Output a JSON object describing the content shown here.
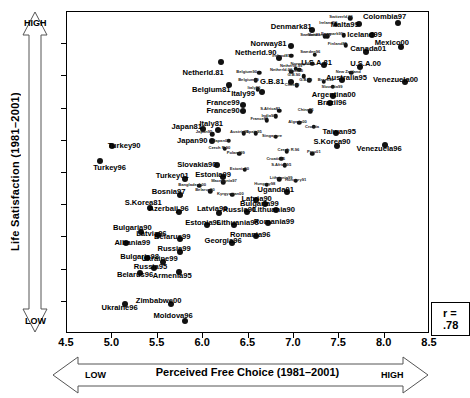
{
  "chart_data": {
    "type": "scatter",
    "title": "",
    "xlabel": "Perceived Free Choice (1981–2001)",
    "ylabel": "Life Satisfaction (1981–2001)",
    "xlim": [
      4.5,
      8.5
    ],
    "ylim": [
      3.5,
      8.5
    ],
    "xticks": [
      "4.5",
      "5.0",
      "5.5",
      "6.0",
      "6.5",
      "7.0",
      "7.5",
      "8.0",
      "8.5"
    ],
    "yticks": [
      "3.5",
      "4.0",
      "4.5",
      "5.0",
      "5.5",
      "6.0",
      "6.5",
      "7.0",
      "7.5",
      "8.0",
      "8.5"
    ],
    "grid": false,
    "legend": "none",
    "annotation": "r = .78",
    "x_axis_low_label": "LOW",
    "x_axis_high_label": "HIGH",
    "y_axis_low_label": "LOW",
    "y_axis_high_label": "HIGH",
    "marker_color": "#111111",
    "points": [
      {
        "label": "Netherld.81",
        "x": 6.2,
        "y": 7.72,
        "lx": 6.0,
        "ly": 7.56,
        "big": true
      },
      {
        "label": "Netherld.90",
        "x": 6.84,
        "y": 7.78,
        "lx": 6.58,
        "ly": 7.86,
        "big": true
      },
      {
        "label": "Netherld.99",
        "x": 7.02,
        "y": 7.62,
        "lx": 6.97,
        "ly": 7.66,
        "s": true
      },
      {
        "label": "Netherld.00",
        "x": 6.97,
        "y": 7.57,
        "lx": 6.86,
        "ly": 7.6,
        "s": true
      },
      {
        "label": "Denmark81",
        "x": 7.2,
        "y": 8.22,
        "lx": 6.97,
        "ly": 8.27,
        "big": true
      },
      {
        "label": "Norway81",
        "x": 6.97,
        "y": 7.97,
        "lx": 6.72,
        "ly": 8.0,
        "big": true
      },
      {
        "label": "Sweden81",
        "x": 7.34,
        "y": 8.12,
        "lx": 7.18,
        "ly": 8.14,
        "s": true
      },
      {
        "label": "Ireland81",
        "x": 6.97,
        "y": 7.82,
        "lx": 6.86,
        "ly": 7.82,
        "s": true
      },
      {
        "label": "Ireland90",
        "x": 7.46,
        "y": 8.3,
        "lx": 7.38,
        "ly": 8.33,
        "s": true
      },
      {
        "label": "Switzerld.96",
        "x": 7.62,
        "y": 8.4,
        "lx": 7.52,
        "ly": 8.43,
        "s": true
      },
      {
        "label": "Malta99",
        "x": 7.72,
        "y": 8.32,
        "lx": 7.56,
        "ly": 8.3,
        "big": true
      },
      {
        "label": "Colombia97",
        "x": 8.15,
        "y": 8.33,
        "lx": 8.0,
        "ly": 8.42,
        "big": true
      },
      {
        "label": "Iceland99",
        "x": 7.86,
        "y": 8.14,
        "lx": 7.78,
        "ly": 8.14,
        "big": true
      },
      {
        "label": "Denmark99",
        "x": 7.55,
        "y": 8.14,
        "lx": 7.42,
        "ly": 8.16,
        "s": true
      },
      {
        "label": "Switzerld.89",
        "x": 7.37,
        "y": 8.12,
        "lx": 7.28,
        "ly": 8.14,
        "s": true
      },
      {
        "label": "Mexico00",
        "x": 8.18,
        "y": 7.96,
        "lx": 8.08,
        "ly": 8.02,
        "big": true
      },
      {
        "label": "Finland81",
        "x": 7.57,
        "y": 7.98,
        "lx": 7.48,
        "ly": 8.0,
        "s": true
      },
      {
        "label": "Canada01",
        "x": 7.79,
        "y": 7.88,
        "lx": 7.82,
        "ly": 7.92,
        "big": true
      },
      {
        "label": "U.S.A.81",
        "x": 7.33,
        "y": 7.68,
        "lx": 7.25,
        "ly": 7.71,
        "big": true
      },
      {
        "label": "U.S.A.00",
        "x": 7.73,
        "y": 7.64,
        "lx": 7.79,
        "ly": 7.69,
        "big": true
      },
      {
        "label": "New Zealand",
        "x": 7.63,
        "y": 7.56,
        "lx": 7.6,
        "ly": 7.57,
        "s": true
      },
      {
        "label": "Norway96",
        "x": 7.2,
        "y": 7.7,
        "lx": 7.07,
        "ly": 7.7,
        "s": true
      },
      {
        "label": "Sweden96",
        "x": 7.23,
        "y": 7.84,
        "lx": 7.18,
        "ly": 7.88,
        "s": true
      },
      {
        "label": "Australia95",
        "x": 7.53,
        "y": 7.44,
        "lx": 7.58,
        "ly": 7.48,
        "big": true
      },
      {
        "label": "Venezuela00",
        "x": 8.23,
        "y": 7.42,
        "lx": 8.12,
        "ly": 7.44,
        "big": true
      },
      {
        "label": "G.B.81",
        "x": 6.97,
        "y": 7.42,
        "lx": 6.76,
        "ly": 7.42,
        "big": true
      },
      {
        "label": "G.B.90",
        "x": 7.11,
        "y": 7.5,
        "lx": 7.0,
        "ly": 7.52,
        "s": true
      },
      {
        "label": "G.B.99",
        "x": 7.17,
        "y": 7.44,
        "lx": 7.13,
        "ly": 7.44,
        "s": true
      },
      {
        "label": "Belgium81",
        "x": 6.29,
        "y": 7.36,
        "lx": 6.09,
        "ly": 7.29,
        "big": true
      },
      {
        "label": "Belgium90",
        "x": 6.62,
        "y": 7.56,
        "lx": 6.48,
        "ly": 7.57,
        "s": true
      },
      {
        "label": "Belgium99",
        "x": 6.58,
        "y": 7.44,
        "lx": 6.5,
        "ly": 7.44,
        "s": true
      },
      {
        "label": "Italy99",
        "x": 6.65,
        "y": 7.26,
        "lx": 6.44,
        "ly": 7.22,
        "big": true
      },
      {
        "label": "Italy90",
        "x": 6.6,
        "y": 7.3,
        "lx": 6.56,
        "ly": 7.32,
        "s": true
      },
      {
        "label": "Chile00",
        "x": 7.06,
        "y": 7.6,
        "lx": 7.02,
        "ly": 7.58,
        "s": true
      },
      {
        "label": "Chile90",
        "x": 7.03,
        "y": 7.36,
        "lx": 6.98,
        "ly": 7.36,
        "s": true
      },
      {
        "label": "Brazil90",
        "x": 7.33,
        "y": 7.42,
        "lx": 7.35,
        "ly": 7.44,
        "s": true
      },
      {
        "label": "Slovakia99",
        "x": 7.43,
        "y": 7.34,
        "lx": 7.42,
        "ly": 7.34,
        "s": true
      },
      {
        "label": "Argentina00",
        "x": 7.43,
        "y": 7.2,
        "lx": 7.44,
        "ly": 7.21,
        "big": true
      },
      {
        "label": "Brazil96",
        "x": 7.4,
        "y": 7.08,
        "lx": 7.42,
        "ly": 7.08,
        "big": true
      },
      {
        "label": "France99",
        "x": 6.44,
        "y": 7.06,
        "lx": 6.22,
        "ly": 7.08,
        "big": true
      },
      {
        "label": "France90",
        "x": 6.44,
        "y": 6.96,
        "lx": 6.22,
        "ly": 6.96,
        "big": true
      },
      {
        "label": "France81",
        "x": 6.7,
        "y": 6.82,
        "lx": 6.62,
        "ly": 6.84,
        "s": true
      },
      {
        "label": "S.Africa81",
        "x": 6.84,
        "y": 6.97,
        "lx": 6.74,
        "ly": 6.99,
        "s": true
      },
      {
        "label": "India90",
        "x": 6.8,
        "y": 6.88,
        "lx": 6.72,
        "ly": 6.88,
        "s": true
      },
      {
        "label": "China95",
        "x": 7.18,
        "y": 6.96,
        "lx": 7.13,
        "ly": 6.98,
        "s": true
      },
      {
        "label": "Japan81",
        "x": 6.0,
        "y": 6.68,
        "lx": 5.82,
        "ly": 6.72,
        "big": true
      },
      {
        "label": "Italy81",
        "x": 6.16,
        "y": 6.66,
        "lx": 6.09,
        "ly": 6.76,
        "big": true
      },
      {
        "label": "Japan95",
        "x": 6.1,
        "y": 6.6,
        "lx": 6.01,
        "ly": 6.64,
        "s": true
      },
      {
        "label": "Japan90",
        "x": 6.1,
        "y": 6.5,
        "lx": 5.88,
        "ly": 6.5,
        "big": true
      },
      {
        "label": "Japan00",
        "x": 6.28,
        "y": 6.5,
        "lx": 6.2,
        "ly": 6.5,
        "s": true
      },
      {
        "label": "Austria90",
        "x": 6.45,
        "y": 6.62,
        "lx": 6.4,
        "ly": 6.64,
        "s": true
      },
      {
        "label": "Spain95",
        "x": 6.58,
        "y": 6.62,
        "lx": 6.56,
        "ly": 6.63,
        "s": true
      },
      {
        "label": "Singapore",
        "x": 6.8,
        "y": 6.56,
        "lx": 6.76,
        "ly": 6.58,
        "s": true
      },
      {
        "label": "Taiwan95",
        "x": 7.46,
        "y": 6.62,
        "lx": 7.5,
        "ly": 6.63,
        "big": true
      },
      {
        "label": "S.Korea90",
        "x": 7.48,
        "y": 6.42,
        "lx": 7.42,
        "ly": 6.48,
        "big": true
      },
      {
        "label": "Venezuela96",
        "x": 8.0,
        "y": 6.44,
        "lx": 7.94,
        "ly": 6.38,
        "big": true
      },
      {
        "label": "Czech R.90",
        "x": 6.24,
        "y": 6.38,
        "lx": 6.18,
        "ly": 6.39,
        "s": true
      },
      {
        "label": "Poland99",
        "x": 6.4,
        "y": 6.3,
        "lx": 6.36,
        "ly": 6.31,
        "s": true
      },
      {
        "label": "Czech R.96",
        "x": 6.92,
        "y": 6.34,
        "lx": 6.94,
        "ly": 6.35,
        "s": true
      },
      {
        "label": "Algeria00",
        "x": 7.06,
        "y": 6.78,
        "lx": 7.04,
        "ly": 6.79,
        "s": true
      },
      {
        "label": "Croatia",
        "x": 7.22,
        "y": 6.72,
        "lx": 7.2,
        "ly": 6.72,
        "s": true
      },
      {
        "label": "Turkey90",
        "x": 5.0,
        "y": 6.42,
        "lx": 5.13,
        "ly": 6.42,
        "big": true
      },
      {
        "label": "Turkey96",
        "x": 4.86,
        "y": 6.18,
        "lx": 4.97,
        "ly": 6.08,
        "big": true
      },
      {
        "label": "Slovakia90",
        "x": 6.15,
        "y": 6.12,
        "lx": 5.93,
        "ly": 6.12,
        "big": true
      },
      {
        "label": "Estonia90",
        "x": 6.46,
        "y": 6.05,
        "lx": 6.4,
        "ly": 6.06,
        "s": true
      },
      {
        "label": "Croatia95",
        "x": 6.86,
        "y": 6.22,
        "lx": 6.8,
        "ly": 6.22,
        "s": true
      },
      {
        "label": "Peru01",
        "x": 7.2,
        "y": 6.3,
        "lx": 7.22,
        "ly": 6.32,
        "s": true
      },
      {
        "label": "S.Africa95",
        "x": 6.9,
        "y": 6.12,
        "lx": 6.86,
        "ly": 6.13,
        "s": true
      },
      {
        "label": "Turkey01",
        "x": 5.8,
        "y": 5.9,
        "lx": 5.66,
        "ly": 5.95,
        "big": true
      },
      {
        "label": "Estonia99",
        "x": 6.22,
        "y": 5.94,
        "lx": 6.11,
        "ly": 5.97,
        "big": true
      },
      {
        "label": "Macedonia97",
        "x": 6.22,
        "y": 5.86,
        "lx": 6.23,
        "ly": 5.87,
        "s": true
      },
      {
        "label": "Bangladesh00",
        "x": 5.96,
        "y": 5.8,
        "lx": 5.88,
        "ly": 5.81,
        "s": true
      },
      {
        "label": "Hungary98",
        "x": 6.7,
        "y": 5.82,
        "lx": 6.68,
        "ly": 5.83,
        "s": true
      },
      {
        "label": "Hungary91",
        "x": 7.02,
        "y": 5.88,
        "lx": 7.02,
        "ly": 5.89,
        "s": true
      },
      {
        "label": "Lithuania99",
        "x": 6.84,
        "y": 5.9,
        "lx": 6.86,
        "ly": 5.92,
        "s": true
      },
      {
        "label": "Uganda01",
        "x": 6.92,
        "y": 5.7,
        "lx": 6.8,
        "ly": 5.74,
        "big": true
      },
      {
        "label": "Bosnia97",
        "x": 5.74,
        "y": 5.66,
        "lx": 5.62,
        "ly": 5.7,
        "big": true
      },
      {
        "label": "Belarus90",
        "x": 6.08,
        "y": 5.72,
        "lx": 6.02,
        "ly": 5.73,
        "s": true
      },
      {
        "label": "Kyrgyzstan00",
        "x": 6.32,
        "y": 5.66,
        "lx": 6.3,
        "ly": 5.67,
        "s": true
      },
      {
        "label": "Latvia90",
        "x": 6.58,
        "y": 5.58,
        "lx": 6.59,
        "ly": 5.6,
        "big": true
      },
      {
        "label": "Bulgaria99",
        "x": 6.68,
        "y": 5.52,
        "lx": 6.62,
        "ly": 5.52,
        "big": true
      },
      {
        "label": "S.Korea81",
        "x": 5.41,
        "y": 5.46,
        "lx": 5.34,
        "ly": 5.54,
        "big": true
      },
      {
        "label": "Azerbaij.96",
        "x": 5.73,
        "y": 5.4,
        "lx": 5.62,
        "ly": 5.44,
        "big": true
      },
      {
        "label": "Latvia99",
        "x": 6.17,
        "y": 5.38,
        "lx": 6.1,
        "ly": 5.44,
        "big": true
      },
      {
        "label": "Russia90",
        "x": 6.48,
        "y": 5.4,
        "lx": 6.4,
        "ly": 5.42,
        "big": true
      },
      {
        "label": "Lithuania90",
        "x": 6.8,
        "y": 5.42,
        "lx": 6.78,
        "ly": 5.43,
        "big": true
      },
      {
        "label": "Bulgaria90",
        "x": 5.32,
        "y": 5.08,
        "lx": 5.22,
        "ly": 5.14,
        "big": true
      },
      {
        "label": "Latvia96",
        "x": 5.5,
        "y": 5.04,
        "lx": 5.43,
        "ly": 5.06,
        "big": true
      },
      {
        "label": "Albania99",
        "x": 5.15,
        "y": 4.92,
        "lx": 5.22,
        "ly": 4.92,
        "big": true
      },
      {
        "label": "Estonia96",
        "x": 6.04,
        "y": 5.2,
        "lx": 6.0,
        "ly": 5.22,
        "big": true
      },
      {
        "label": "Lithuania96",
        "x": 6.34,
        "y": 5.2,
        "lx": 6.38,
        "ly": 5.22,
        "big": true
      },
      {
        "label": "Romania99",
        "x": 6.72,
        "y": 5.22,
        "lx": 6.78,
        "ly": 5.24,
        "big": true
      },
      {
        "label": "Romania96",
        "x": 6.58,
        "y": 5.02,
        "lx": 6.52,
        "ly": 5.04,
        "big": true
      },
      {
        "label": "Belarus99",
        "x": 5.74,
        "y": 4.98,
        "lx": 5.66,
        "ly": 5.0,
        "big": true
      },
      {
        "label": "Georgia96",
        "x": 6.32,
        "y": 4.92,
        "lx": 6.22,
        "ly": 4.94,
        "big": true
      },
      {
        "label": "Russia99",
        "x": 5.75,
        "y": 4.78,
        "lx": 5.68,
        "ly": 4.82,
        "big": true
      },
      {
        "label": "Bulgaria98",
        "x": 5.38,
        "y": 4.68,
        "lx": 5.3,
        "ly": 4.7,
        "big": true
      },
      {
        "label": "Ukraine99",
        "x": 5.56,
        "y": 4.62,
        "lx": 5.52,
        "ly": 4.66,
        "big": true
      },
      {
        "label": "Russia95",
        "x": 5.46,
        "y": 4.52,
        "lx": 5.42,
        "ly": 4.54,
        "big": true
      },
      {
        "label": "Belarus96",
        "x": 5.3,
        "y": 4.44,
        "lx": 5.25,
        "ly": 4.42,
        "big": true
      },
      {
        "label": "Armenia95",
        "x": 5.73,
        "y": 4.46,
        "lx": 5.66,
        "ly": 4.4,
        "big": true
      },
      {
        "label": "Zimbabwe00",
        "x": 5.65,
        "y": 3.96,
        "lx": 5.51,
        "ly": 4.02,
        "big": true
      },
      {
        "label": "Ukraine96",
        "x": 5.14,
        "y": 3.96,
        "lx": 5.08,
        "ly": 3.9,
        "big": true
      },
      {
        "label": "Moldova96",
        "x": 5.8,
        "y": 3.7,
        "lx": 5.67,
        "ly": 3.78,
        "big": true
      }
    ]
  }
}
